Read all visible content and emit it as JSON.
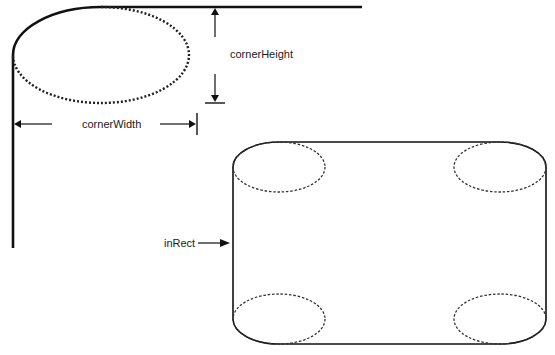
{
  "diagram": {
    "type": "rounded-rectangle-geometry",
    "labels": {
      "corner_height": "cornerHeight",
      "corner_width": "cornerWidth",
      "in_rect": "inRect"
    },
    "colors": {
      "stroke": "#111111",
      "background": "#ffffff"
    },
    "detail_view": {
      "description": "Enlarged top-left corner of a rounded rectangle with the corner oval shown dotted",
      "corner_oval": {
        "cx": 101,
        "cy": 55,
        "rx": 88,
        "ry": 48
      }
    },
    "overview": {
      "description": "Full rounded rectangle (inRect) with four dashed corner ovals",
      "rect": {
        "left": 233,
        "top": 142,
        "right": 546,
        "bottom": 344
      },
      "corner_ovals": [
        "top-left",
        "top-right",
        "bottom-left",
        "bottom-right"
      ]
    }
  }
}
